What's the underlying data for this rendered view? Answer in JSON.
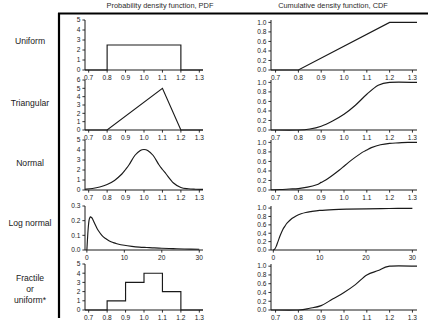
{
  "figure": {
    "columns": [
      {
        "id": "pdf",
        "title": "Probability density function, PDF"
      },
      {
        "id": "cdf",
        "title": "Cumulative density function, CDF"
      }
    ],
    "rows": [
      {
        "id": "uniform",
        "label": "Uniform",
        "label_lines": [
          "Uniform"
        ]
      },
      {
        "id": "triangular",
        "label": "Triangular",
        "label_lines": [
          "Triangular"
        ]
      },
      {
        "id": "normal",
        "label": "Normal",
        "label_lines": [
          "Normal"
        ]
      },
      {
        "id": "lognormal",
        "label": "Log normal",
        "label_lines": [
          "Log normal"
        ]
      },
      {
        "id": "fractile",
        "label": "Fractile or uniform*",
        "label_lines": [
          "Fractile",
          "or",
          "uniform*"
        ]
      }
    ]
  },
  "chart_data": [
    {
      "id": "uniform-pdf",
      "type": "line",
      "row": "Uniform",
      "column": "Probability density function, PDF",
      "title": "",
      "xlabel": "",
      "ylabel": "",
      "xlim": [
        0.68,
        1.32
      ],
      "ylim": [
        0,
        5
      ],
      "grid": false,
      "legend": "none",
      "xticks": [
        "0.7",
        "0.8",
        "0.9",
        "1.0",
        "1.1",
        "1.2",
        "1.3"
      ],
      "xtick_values": [
        0.7,
        0.8,
        0.9,
        1.0,
        1.1,
        1.2,
        1.3
      ],
      "yticks": [
        "0",
        "1",
        "2",
        "3",
        "4",
        "5"
      ],
      "ytick_values": [
        0,
        1,
        2,
        3,
        4,
        5
      ],
      "x": [
        0.68,
        0.8,
        0.8,
        1.2,
        1.2,
        1.32
      ],
      "y": [
        0,
        0,
        2.5,
        2.5,
        0,
        0
      ]
    },
    {
      "id": "uniform-cdf",
      "type": "line",
      "row": "Uniform",
      "column": "Cumulative density function, CDF",
      "title": "",
      "xlabel": "",
      "ylabel": "",
      "xlim": [
        0.68,
        1.32
      ],
      "ylim": [
        0,
        1.05
      ],
      "grid": false,
      "legend": "none",
      "xticks": [
        "0.7",
        "0.8",
        "0.9",
        "1.0",
        "1.1",
        "1.2",
        "1.3"
      ],
      "xtick_values": [
        0.7,
        0.8,
        0.9,
        1.0,
        1.1,
        1.2,
        1.3
      ],
      "yticks": [
        "0.0",
        "0.2",
        "0.4",
        "0.6",
        "0.8",
        "1.0"
      ],
      "ytick_values": [
        0.0,
        0.2,
        0.4,
        0.6,
        0.8,
        1.0
      ],
      "x": [
        0.68,
        0.8,
        1.2,
        1.32
      ],
      "y": [
        0,
        0,
        1.0,
        1.0
      ]
    },
    {
      "id": "triangular-pdf",
      "type": "line",
      "row": "Triangular",
      "column": "Probability density function, PDF",
      "title": "",
      "xlabel": "",
      "ylabel": "",
      "xlim": [
        0.68,
        1.32
      ],
      "ylim": [
        0,
        6
      ],
      "grid": false,
      "legend": "none",
      "xticks": [
        "0.7",
        "0.8",
        "0.9",
        "1.0",
        "1.1",
        "1.2",
        "1.3"
      ],
      "xtick_values": [
        0.7,
        0.8,
        0.9,
        1.0,
        1.1,
        1.2,
        1.3
      ],
      "yticks": [
        "0",
        "1",
        "2",
        "3",
        "4",
        "5",
        "6"
      ],
      "ytick_values": [
        0,
        1,
        2,
        3,
        4,
        5,
        6
      ],
      "x": [
        0.68,
        0.8,
        1.1,
        1.2,
        1.32
      ],
      "y": [
        0,
        0,
        5.0,
        0,
        0
      ]
    },
    {
      "id": "triangular-cdf",
      "type": "line",
      "row": "Triangular",
      "column": "Cumulative density function, CDF",
      "title": "",
      "xlabel": "",
      "ylabel": "",
      "xlim": [
        0.68,
        1.32
      ],
      "ylim": [
        0,
        1.05
      ],
      "grid": false,
      "legend": "none",
      "xticks": [
        "0.7",
        "0.8",
        "0.9",
        "1.0",
        "1.1",
        "1.2",
        "1.3"
      ],
      "xtick_values": [
        0.7,
        0.8,
        0.9,
        1.0,
        1.1,
        1.2,
        1.3
      ],
      "yticks": [
        "0.0",
        "0.2",
        "0.4",
        "0.6",
        "0.8",
        "1.0"
      ],
      "ytick_values": [
        0.0,
        0.2,
        0.4,
        0.6,
        0.8,
        1.0
      ],
      "x": [
        0.68,
        0.8,
        0.85,
        0.9,
        0.95,
        1.0,
        1.05,
        1.1,
        1.15,
        1.2,
        1.32
      ],
      "y": [
        0,
        0,
        0.02,
        0.08,
        0.19,
        0.33,
        0.52,
        0.75,
        0.94,
        1.0,
        1.0
      ]
    },
    {
      "id": "normal-pdf",
      "type": "line",
      "row": "Normal",
      "column": "Probability density function, PDF",
      "title": "",
      "xlabel": "",
      "ylabel": "",
      "xlim": [
        0.68,
        1.32
      ],
      "ylim": [
        0,
        5
      ],
      "grid": false,
      "legend": "none",
      "xticks": [
        "0.7",
        "0.8",
        "0.9",
        "1.0",
        "1.1",
        "1.2",
        "1.3"
      ],
      "xtick_values": [
        0.7,
        0.8,
        0.9,
        1.0,
        1.1,
        1.2,
        1.3
      ],
      "yticks": [
        "0",
        "1",
        "2",
        "3",
        "4",
        "5"
      ],
      "ytick_values": [
        0,
        1,
        2,
        3,
        4,
        5
      ],
      "distribution": {
        "mean": 1.0,
        "sd": 0.1
      },
      "x": [
        0.68,
        0.72,
        0.76,
        0.8,
        0.84,
        0.88,
        0.9,
        0.92,
        0.95,
        0.98,
        1.0,
        1.02,
        1.05,
        1.08,
        1.1,
        1.12,
        1.16,
        1.2,
        1.24,
        1.28,
        1.32
      ],
      "y": [
        0.08,
        0.15,
        0.3,
        0.55,
        0.95,
        1.6,
        2.05,
        2.55,
        3.45,
        3.95,
        4.05,
        3.95,
        3.45,
        2.55,
        2.05,
        1.6,
        0.7,
        0.25,
        0.12,
        0.08,
        0.06
      ]
    },
    {
      "id": "normal-cdf",
      "type": "line",
      "row": "Normal",
      "column": "Cumulative density function, CDF",
      "title": "",
      "xlabel": "",
      "ylabel": "",
      "xlim": [
        0.68,
        1.32
      ],
      "ylim": [
        0,
        1.05
      ],
      "grid": false,
      "legend": "none",
      "xticks": [
        "0.7",
        "0.8",
        "0.9",
        "1.0",
        "1.1",
        "1.2",
        "1.3"
      ],
      "xtick_values": [
        0.7,
        0.8,
        0.9,
        1.0,
        1.1,
        1.2,
        1.3
      ],
      "yticks": [
        "0.0",
        "0.2",
        "0.4",
        "0.6",
        "0.8",
        "1.0"
      ],
      "ytick_values": [
        0.0,
        0.2,
        0.4,
        0.6,
        0.8,
        1.0
      ],
      "x": [
        0.68,
        0.72,
        0.76,
        0.8,
        0.84,
        0.88,
        0.9,
        0.92,
        0.95,
        0.98,
        1.0,
        1.02,
        1.05,
        1.08,
        1.1,
        1.12,
        1.16,
        1.2,
        1.24,
        1.28,
        1.32
      ],
      "y": [
        0.005,
        0.01,
        0.02,
        0.03,
        0.06,
        0.11,
        0.16,
        0.21,
        0.31,
        0.42,
        0.5,
        0.58,
        0.69,
        0.79,
        0.84,
        0.89,
        0.95,
        0.98,
        0.99,
        1.0,
        1.0
      ]
    },
    {
      "id": "lognormal-pdf",
      "type": "line",
      "row": "Log normal",
      "column": "Probability density function, PDF",
      "title": "",
      "xlabel": "",
      "ylabel": "",
      "xlim": [
        -0.5,
        31
      ],
      "ylim": [
        0,
        0.3
      ],
      "grid": false,
      "legend": "none",
      "xticks": [
        "0",
        "10",
        "20",
        "30"
      ],
      "xtick_values": [
        0,
        10,
        20,
        30
      ],
      "yticks": [
        "0.0",
        "0.1",
        "0.2",
        "0.3"
      ],
      "ytick_values": [
        0.0,
        0.1,
        0.2,
        0.3
      ],
      "x": [
        0,
        0.3,
        0.6,
        0.9,
        1.2,
        1.5,
        2,
        2.5,
        3,
        4,
        5,
        6,
        7,
        8,
        10,
        12,
        14,
        16,
        18,
        20,
        23,
        26,
        30
      ],
      "y": [
        0,
        0.13,
        0.205,
        0.225,
        0.222,
        0.213,
        0.185,
        0.158,
        0.135,
        0.1,
        0.078,
        0.062,
        0.051,
        0.043,
        0.032,
        0.025,
        0.02,
        0.017,
        0.014,
        0.012,
        0.009,
        0.007,
        0.005
      ]
    },
    {
      "id": "lognormal-cdf",
      "type": "line",
      "row": "Log normal",
      "column": "Cumulative density function, CDF",
      "title": "",
      "xlabel": "",
      "ylabel": "",
      "xlim": [
        -0.5,
        31
      ],
      "ylim": [
        0,
        1.05
      ],
      "grid": false,
      "legend": "none",
      "xticks": [
        "0",
        "10",
        "20",
        "30"
      ],
      "xtick_values": [
        0,
        10,
        20,
        30
      ],
      "yticks": [
        "0.0",
        "0.2",
        "0.4",
        "0.6",
        "0.8",
        "1.0"
      ],
      "ytick_values": [
        0.0,
        0.2,
        0.4,
        0.6,
        0.8,
        1.0
      ],
      "x": [
        0,
        0.3,
        0.6,
        1,
        1.5,
        2,
        2.5,
        3,
        4,
        5,
        6,
        7,
        8,
        10,
        13,
        16,
        20,
        25,
        30
      ],
      "y": [
        0,
        0.02,
        0.08,
        0.2,
        0.35,
        0.48,
        0.57,
        0.645,
        0.75,
        0.82,
        0.865,
        0.895,
        0.915,
        0.945,
        0.965,
        0.975,
        0.983,
        0.99,
        0.995
      ]
    },
    {
      "id": "fractile-pdf",
      "type": "bar",
      "row": "Fractile or uniform*",
      "column": "Probability density function, PDF",
      "title": "",
      "xlabel": "",
      "ylabel": "",
      "xlim": [
        0.68,
        1.32
      ],
      "ylim": [
        0,
        5
      ],
      "grid": false,
      "legend": "none",
      "xticks": [
        "0.7",
        "0.8",
        "0.9",
        "1.0",
        "1.1",
        "1.2",
        "1.3"
      ],
      "xtick_values": [
        0.7,
        0.8,
        0.9,
        1.0,
        1.1,
        1.2,
        1.3
      ],
      "yticks": [
        "0",
        "1",
        "2",
        "3",
        "4",
        "5"
      ],
      "ytick_values": [
        0,
        1,
        2,
        3,
        4,
        5
      ],
      "bin_edges": [
        0.8,
        0.9,
        1.0,
        1.1,
        1.2
      ],
      "categories": [
        "0.8-0.9",
        "0.9-1.0",
        "1.0-1.1",
        "1.1-1.2"
      ],
      "values": [
        1,
        3,
        4,
        2
      ]
    },
    {
      "id": "fractile-cdf",
      "type": "line",
      "row": "Fractile or uniform*",
      "column": "Cumulative density function, CDF",
      "title": "",
      "xlabel": "",
      "ylabel": "",
      "xlim": [
        0.68,
        1.32
      ],
      "ylim": [
        0,
        1.05
      ],
      "grid": false,
      "legend": "none",
      "xticks": [
        "0.7",
        "0.8",
        "0.9",
        "1.0",
        "1.1",
        "1.2",
        "1.3"
      ],
      "xtick_values": [
        0.7,
        0.8,
        0.9,
        1.0,
        1.1,
        1.2,
        1.3
      ],
      "yticks": [
        "0.0",
        "0.2",
        "0.4",
        "0.6",
        "0.8",
        "1.0"
      ],
      "ytick_values": [
        0.0,
        0.2,
        0.4,
        0.6,
        0.8,
        1.0
      ],
      "x": [
        0.68,
        0.8,
        0.85,
        0.9,
        0.95,
        1.0,
        1.05,
        1.1,
        1.15,
        1.2,
        1.32
      ],
      "y": [
        0,
        0.0,
        0.04,
        0.1,
        0.25,
        0.4,
        0.58,
        0.8,
        0.9,
        1.0,
        1.0
      ]
    }
  ]
}
